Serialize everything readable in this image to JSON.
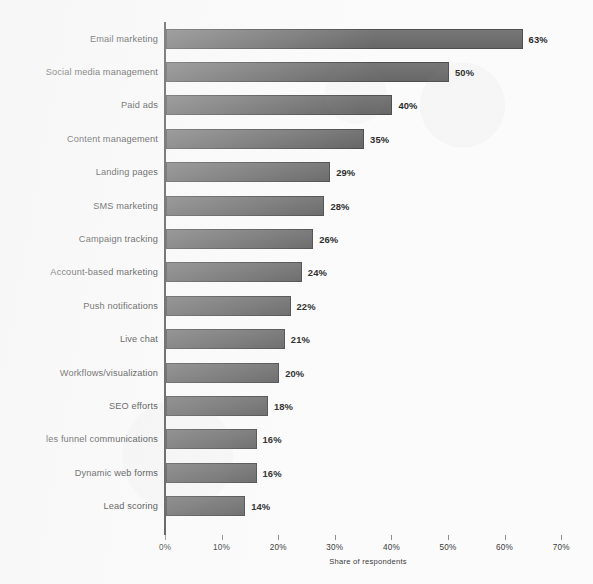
{
  "chart_data": {
    "type": "bar",
    "orientation": "horizontal",
    "title": "",
    "xlabel": "Share of respondents",
    "ylabel": "",
    "xlim": [
      0,
      70
    ],
    "xtick_labels": [
      "0%",
      "10%",
      "20%",
      "30%",
      "40%",
      "50%",
      "60%",
      "70%"
    ],
    "xticks": [
      0,
      10,
      20,
      30,
      40,
      50,
      60,
      70
    ],
    "grid": false,
    "legend": null,
    "bar_color": "#6e6e6e",
    "bar_edge_color": "#4f4f4f",
    "categories": [
      "Email marketing",
      "Social media management",
      "Paid ads",
      "Content management",
      "Landing pages",
      "SMS marketing",
      "Campaign tracking",
      "Account-based marketing",
      "Push notifications",
      "Live chat",
      "Workflows/visualization",
      "SEO efforts",
      "les funnel communications",
      "Dynamic web forms",
      "Lead scoring"
    ],
    "values": [
      63,
      50,
      40,
      35,
      29,
      28,
      26,
      24,
      22,
      21,
      20,
      18,
      16,
      16,
      14
    ],
    "data_labels": [
      "63%",
      "50%",
      "40%",
      "35%",
      "29%",
      "28%",
      "26%",
      "24%",
      "22%",
      "21%",
      "20%",
      "18%",
      "16%",
      "16%",
      "14%"
    ]
  }
}
